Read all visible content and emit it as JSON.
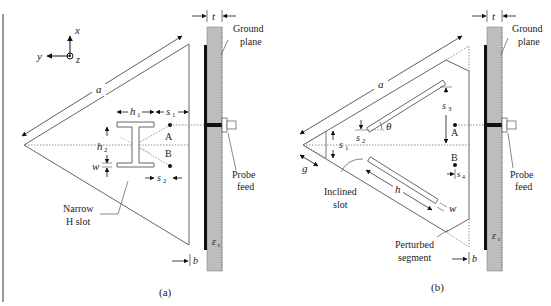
{
  "header": {
    "text": ""
  },
  "panel_a": {
    "caption": "(a)",
    "axes": {
      "x": "x",
      "y": "y",
      "z": "z"
    },
    "dims": {
      "a": "a",
      "t": "t",
      "h1": "h",
      "h1_sub": "1",
      "h2": "h",
      "h2_sub": "2",
      "s1": "s",
      "s1_sub": "1",
      "s2": "s",
      "s2_sub": "2",
      "w": "w",
      "b": "b",
      "er": "ε",
      "er_sub": "r"
    },
    "points": {
      "A": "A",
      "B": "B"
    },
    "labels": {
      "ground_line1": "Ground",
      "ground_line2": "plane",
      "probe_line1": "Probe",
      "probe_line2": "feed",
      "slot_line1": "Narrow",
      "slot_line2": "H slot"
    }
  },
  "panel_b": {
    "caption": "(b)",
    "dims": {
      "a": "a",
      "t": "t",
      "s1": "s",
      "s1_sub": "1",
      "s2": "s",
      "s2_sub": "2",
      "s3": "s",
      "s3_sub": "3",
      "s4": "s",
      "s4_sub": "4",
      "theta": "θ",
      "g": "g",
      "h": "h",
      "w": "w",
      "b": "b",
      "er": "ε",
      "er_sub": "r"
    },
    "points": {
      "A": "A",
      "B": "B"
    },
    "labels": {
      "ground_line1": "Ground",
      "ground_line2": "plane",
      "probe_line1": "Probe",
      "probe_line2": "feed",
      "slot_line1": "Inclined",
      "slot_line2": "slot",
      "seg_line1": "Perturbed",
      "seg_line2": "segment"
    }
  },
  "colors": {
    "substrate": "#b9b9b9",
    "line": "#444444",
    "dotted": "#666666",
    "metal": "#111111"
  }
}
